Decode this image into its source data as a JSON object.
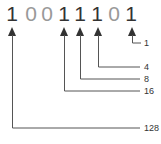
{
  "binary": {
    "digits": [
      "1",
      "0",
      "0",
      "1",
      "1",
      "1",
      "0",
      "1"
    ]
  },
  "weights": {
    "w1": "1",
    "w4": "4",
    "w8": "8",
    "w16": "16",
    "w128": "128"
  },
  "colors": {
    "one": "#333333",
    "zero": "#999999",
    "line": "#555555"
  }
}
